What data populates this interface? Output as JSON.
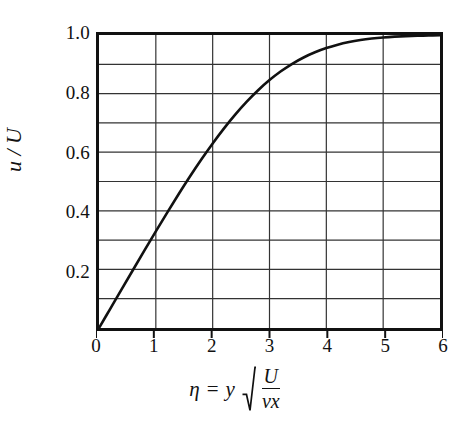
{
  "figure": {
    "background_color": "#ffffff",
    "ink_color": "#111111",
    "grid_color": "#333333"
  },
  "axes": {
    "y_title": "u / U",
    "x_title_parts": {
      "eta": "η",
      "equals": "=",
      "y": "y",
      "numerator": "U",
      "denominator": "νx"
    },
    "x_tick_labels": [
      "0",
      "1",
      "2",
      "3",
      "4",
      "5",
      "6"
    ],
    "y_tick_labels": [
      "1.0",
      "0.8",
      "0.6",
      "0.4",
      "0.2"
    ]
  },
  "chart_data": {
    "type": "line",
    "title": "",
    "subtitle": "",
    "xlabel": "η = y √(U/νx)",
    "ylabel": "u / U",
    "xlim": [
      0,
      6
    ],
    "ylim": [
      0,
      1.0
    ],
    "xticks": [
      0,
      1,
      2,
      3,
      4,
      5,
      6
    ],
    "yticks": [
      0,
      0.2,
      0.4,
      0.6,
      0.8,
      1.0
    ],
    "y_minor_ticks": [
      0.1,
      0.3,
      0.5,
      0.7,
      0.9
    ],
    "grid": true,
    "grid_axis": "both",
    "legend": null,
    "legend_position": "none",
    "annotations": [],
    "series": [
      {
        "name": "Blasius velocity profile",
        "color": "#111111",
        "line_width": 2.6,
        "x": [
          0.0,
          0.2,
          0.4,
          0.6,
          0.8,
          1.0,
          1.2,
          1.4,
          1.6,
          1.8,
          2.0,
          2.2,
          2.4,
          2.6,
          2.8,
          3.0,
          3.2,
          3.4,
          3.6,
          3.8,
          4.0,
          4.2,
          4.4,
          4.6,
          4.8,
          5.0,
          5.2,
          5.4,
          5.6,
          5.8,
          6.0
        ],
        "values": [
          0.0,
          0.0664,
          0.1328,
          0.1989,
          0.2647,
          0.3298,
          0.3938,
          0.4563,
          0.5168,
          0.5748,
          0.6298,
          0.6813,
          0.729,
          0.7725,
          0.8115,
          0.8461,
          0.8761,
          0.9018,
          0.9233,
          0.9411,
          0.9555,
          0.967,
          0.9759,
          0.9827,
          0.9878,
          0.9916,
          0.9943,
          0.9962,
          0.9975,
          0.9984,
          0.999
        ]
      }
    ]
  }
}
